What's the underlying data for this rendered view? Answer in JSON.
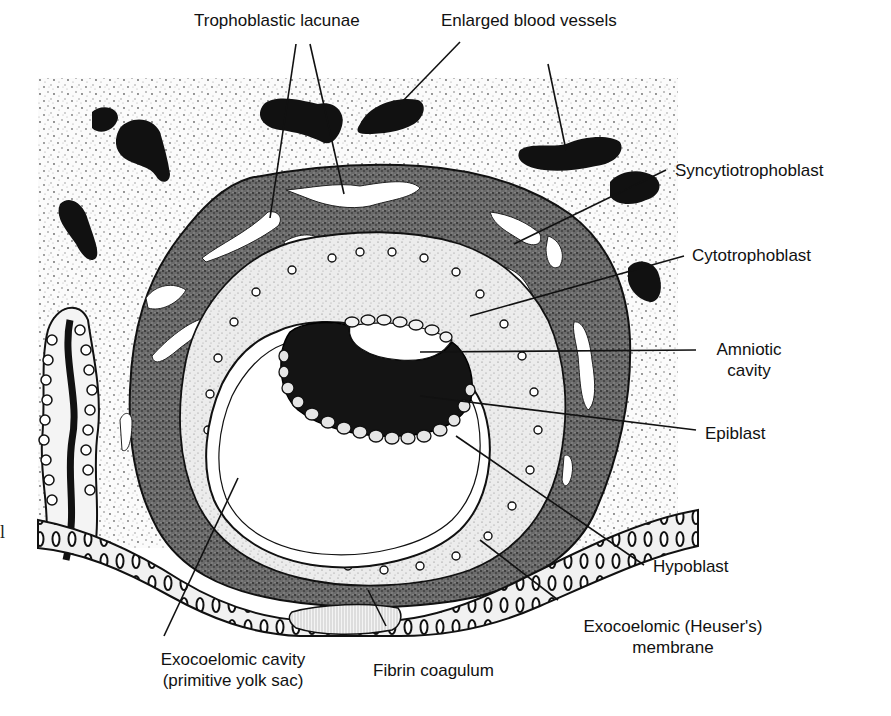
{
  "figure": {
    "colors": {
      "background": "#ffffff",
      "ink": "#111111",
      "stroma_stipple": "#9a9a9a",
      "syncytiotrophoblast": "#5a5a5a",
      "cytotrophoblast": "#d8d8d8",
      "epiblast": "#151515",
      "cavity": "#ffffff"
    }
  },
  "labels": {
    "trophoblastic_lacunae": "Trophoblastic lacunae",
    "enlarged_blood_vessels": "Enlarged blood vessels",
    "syncytiotrophoblast": "Syncytiotrophoblast",
    "cytotrophoblast": "Cytotrophoblast",
    "amniotic_cavity_line1": "Amniotic",
    "amniotic_cavity_line2": "cavity",
    "epiblast": "Epiblast",
    "hypoblast": "Hypoblast",
    "exocoelomic_membrane_line1": "Exocoelomic (Heuser's)",
    "exocoelomic_membrane_line2": "membrane",
    "fibrin_coagulum": "Fibrin coagulum",
    "exocoelomic_cavity_line1": "Exocoelomic cavity",
    "exocoelomic_cavity_line2": "(primitive yolk sac)",
    "stray_margin_char": "l"
  }
}
